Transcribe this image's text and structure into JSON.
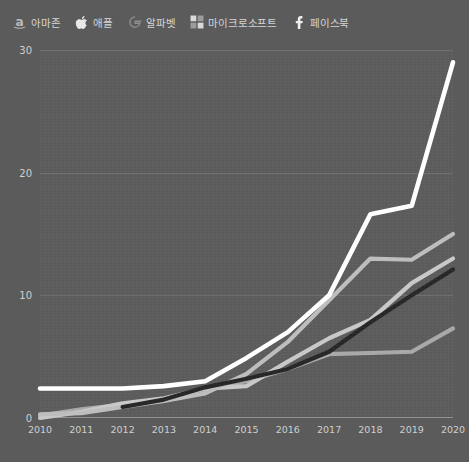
{
  "chart_data": {
    "type": "line",
    "title": "",
    "subtitle": "",
    "xlabel": "",
    "ylabel": "",
    "x": [
      2010,
      2011,
      2012,
      2013,
      2014,
      2015,
      2016,
      2017,
      2018,
      2019,
      2020
    ],
    "xlim": [
      2010,
      2020
    ],
    "ylim": [
      0,
      30
    ],
    "yticks": [
      0,
      10,
      20,
      30
    ],
    "xticks": [
      "2010",
      "2011",
      "2012",
      "2013",
      "2014",
      "2015",
      "2016",
      "2017",
      "2018",
      "2019",
      "2020"
    ],
    "grid": true,
    "legend_position": "top-left",
    "series": [
      {
        "name": "아마존",
        "icon": "amazon-icon",
        "color": "#bdbdbd",
        "values": [
          0.3,
          0.4,
          0.9,
          1.4,
          2.0,
          3.6,
          6.2,
          9.6,
          13.0,
          12.9,
          15.0
        ]
      },
      {
        "name": "애플",
        "icon": "apple-icon",
        "color": "#ffffff",
        "values": [
          2.4,
          2.4,
          2.4,
          2.6,
          3.0,
          4.9,
          7.0,
          10.0,
          16.6,
          17.3,
          29.0
        ]
      },
      {
        "name": "알파벳",
        "icon": "google-icon",
        "color": "#c8c8c8",
        "values": [
          0.0,
          0.5,
          1.2,
          1.6,
          2.4,
          2.6,
          4.6,
          6.5,
          8.0,
          11.0,
          13.0
        ]
      },
      {
        "name": "마이크로소프트",
        "icon": "microsoft-icon",
        "color": "#a8a8a8",
        "values": [
          0.2,
          0.7,
          1.1,
          1.4,
          2.3,
          3.0,
          4.0,
          5.2,
          5.3,
          5.4,
          7.3
        ]
      },
      {
        "name": "페이스북",
        "icon": "facebook-icon",
        "color": "#262626",
        "values": [
          null,
          null,
          0.9,
          1.5,
          2.5,
          3.2,
          4.0,
          5.4,
          7.8,
          10.0,
          12.1
        ]
      }
    ]
  },
  "legend": {
    "items": [
      {
        "label": "아마존",
        "icon": "amazon-icon"
      },
      {
        "label": "애플",
        "icon": "apple-icon"
      },
      {
        "label": "알파벳",
        "icon": "google-icon"
      },
      {
        "label": "마이크로소프트",
        "icon": "microsoft-icon"
      },
      {
        "label": "페이스북",
        "icon": "facebook-icon"
      }
    ]
  },
  "axes": {
    "y_labels": [
      "30",
      "20",
      "10",
      "0"
    ],
    "x_labels": [
      "2010",
      "2011",
      "2012",
      "2013",
      "2014",
      "2015",
      "2016",
      "2017",
      "2018",
      "2019",
      "2020"
    ]
  },
  "colors": {
    "background": "#5b5b5b",
    "gridline": "#6e6e6e",
    "axis": "#8e8e8e",
    "tick_text": "#cfcfcf"
  }
}
